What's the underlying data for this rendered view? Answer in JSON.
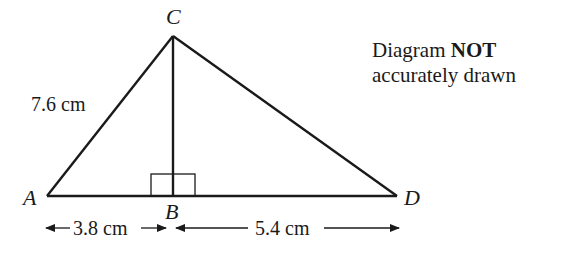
{
  "diagram": {
    "type": "geometry-triangle",
    "points": {
      "A": {
        "label": "A"
      },
      "B": {
        "label": "B"
      },
      "C": {
        "label": "C"
      },
      "D": {
        "label": "D"
      }
    },
    "measurements": {
      "AC": "7.6 cm",
      "AB": "3.8 cm",
      "BD": "5.4 cm"
    },
    "right_angle_at": "B",
    "note": {
      "prefix": "Diagram ",
      "emphasis": "NOT",
      "suffix": "accurately drawn"
    },
    "colors": {
      "line": "#1a1a1a",
      "background": "#ffffff"
    }
  }
}
